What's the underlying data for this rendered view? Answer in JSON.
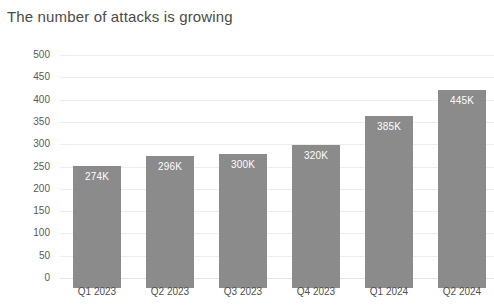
{
  "chart_data": {
    "type": "bar",
    "title": "The number of attacks is growing",
    "xlabel": "",
    "ylabel": "",
    "categories": [
      "Q1 2023",
      "Q2 2023",
      "Q3 2023",
      "Q4 2023",
      "Q1 2024",
      "Q2 2024"
    ],
    "values": [
      274,
      296,
      300,
      320,
      385,
      445
    ],
    "data_labels": [
      "274K",
      "296K",
      "300K",
      "320K",
      "385K",
      "445K"
    ],
    "ylim": [
      0,
      500
    ],
    "yticks": [
      500,
      450,
      400,
      350,
      300,
      250,
      200,
      150,
      100,
      50,
      0
    ],
    "ytick_labels": [
      "500",
      "450",
      "400",
      "350",
      "300",
      "250",
      "200",
      "150",
      "100",
      "50",
      "0"
    ],
    "grid": true,
    "legend": null,
    "bar_color": "#8b8b8b",
    "label_color": "#ffffff",
    "title_color": "#4a4a4a",
    "background": "#ffffff"
  }
}
